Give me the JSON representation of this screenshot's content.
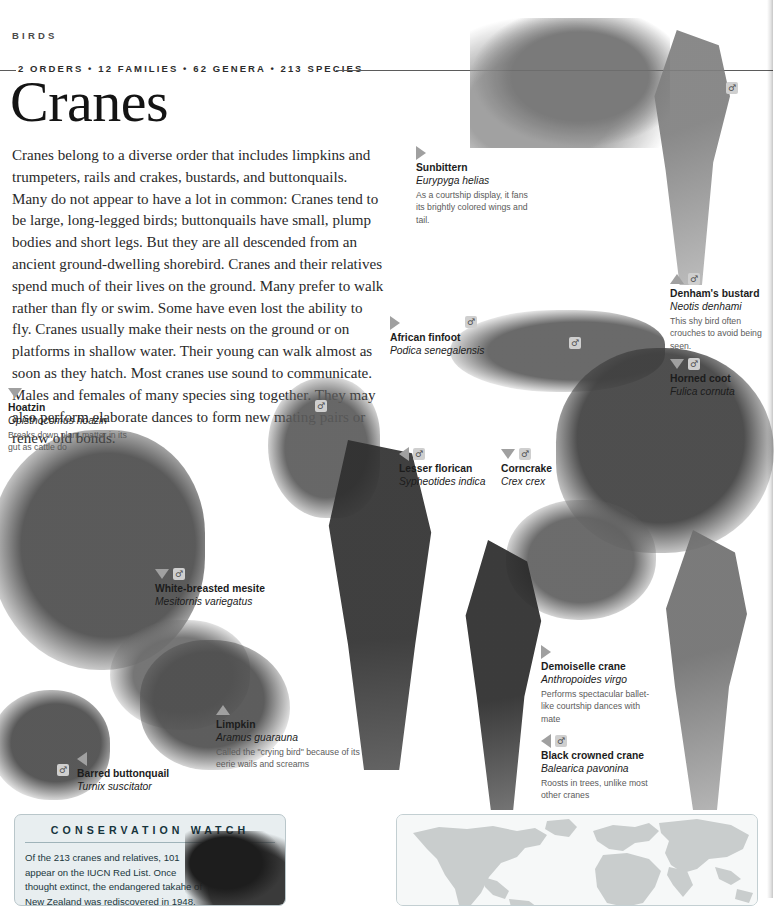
{
  "header": {
    "running_head": "BIRDS",
    "stats": "2 ORDERS • 12 FAMILIES • 62 GENERA • 213 SPECIES",
    "title": "Cranes"
  },
  "intro": "Cranes belong to a diverse order that includes limpkins and trumpeters, rails and crakes, bustards, and buttonquails. Many do not appear to have a lot in common: Cranes tend to be large, long-legged birds; buttonquails have small, plump bodies and short legs. But they are all descended from an ancient ground-dwelling shorebird. Cranes and their relatives spend much of their lives on the ground. Many prefer to walk rather than fly or swim. Some have even lost the ability to fly. Cranes usually make their nests on the ground or on platforms in shallow water. Their young can walk almost as soon as they hatch. Most cranes use sound to communicate. Males and females of many species sing together. They may also perform elaborate dances to form new mating pairs or renew old bonds.",
  "captions": [
    {
      "id": "sunbittern",
      "common": "Sunbittern",
      "latin": "Eurypyga helias",
      "note": "As a courtship display, it fans its brightly colored wings and tail.",
      "pointer": "right",
      "badge": ""
    },
    {
      "id": "denhams-bustard",
      "common": "Denham's bustard",
      "latin": "Neotis denhami",
      "note": "This shy bird often crouches to avoid being seen.",
      "pointer": "up",
      "badge": "♂"
    },
    {
      "id": "horned-coot",
      "common": "Horned coot",
      "latin": "Fulica cornuta",
      "note": "",
      "pointer": "down",
      "badge": "♂"
    },
    {
      "id": "african-finfoot",
      "common": "African finfoot",
      "latin": "Podica senegalensis",
      "note": "",
      "pointer": "right",
      "badge": ""
    },
    {
      "id": "hoatzin",
      "common": "Hoatzin",
      "latin": "Opisthocomus hoazin",
      "note": "Breaks down plant matter in its gut as cattle do",
      "pointer": "down",
      "badge": ""
    },
    {
      "id": "lesser-florican",
      "common": "Lesser florican",
      "latin": "Sypheotides indica",
      "note": "",
      "pointer": "left",
      "badge": "♂"
    },
    {
      "id": "corncrake",
      "common": "Corncrake",
      "latin": "Crex crex",
      "note": "",
      "pointer": "down",
      "badge": "♂"
    },
    {
      "id": "mesite",
      "common": "White-breasted mesite",
      "latin": "Mesitornis variegatus",
      "note": "",
      "pointer": "down",
      "badge": "♂"
    },
    {
      "id": "limpkin",
      "common": "Limpkin",
      "latin": "Aramus guarauna",
      "note": "Called the \"crying bird\" because of its eerie wails and screams",
      "pointer": "up",
      "badge": ""
    },
    {
      "id": "barred-buttonquail",
      "common": "Barred buttonquail",
      "latin": "Turnix suscitator",
      "note": "",
      "pointer": "left",
      "badge": ""
    },
    {
      "id": "demoiselle-crane",
      "common": "Demoiselle crane",
      "latin": "Anthropoides virgo",
      "note": "Performs spectacular ballet-like courtship dances with mate",
      "pointer": "right",
      "badge": ""
    },
    {
      "id": "black-crowned-crane",
      "common": "Black crowned crane",
      "latin": "Balearica pavonina",
      "note": "Roosts in trees, unlike most other cranes",
      "pointer": "left",
      "badge": "♂"
    }
  ],
  "free_badges": [
    {
      "symbol": "♂",
      "x": 726,
      "y": 82
    },
    {
      "symbol": "♂",
      "x": 465,
      "y": 316
    },
    {
      "symbol": "♂",
      "x": 569,
      "y": 337
    },
    {
      "symbol": "♂",
      "x": 315,
      "y": 400
    },
    {
      "symbol": "♂",
      "x": 57,
      "y": 764
    }
  ],
  "conservation": {
    "title": "CONSERVATION WATCH",
    "body": "Of the 213 cranes and relatives, 101 appear on the IUCN Red List. Once thought extinct, the endangered takahe of New Zealand was rediscovered in 1948. Introduced species"
  },
  "colors": {
    "ink": "#231f20",
    "rule": "#5b5b5b",
    "caption_note": "#5b5b5b",
    "pointer": "#a0a0a0",
    "panel_bg": "#e8eef0",
    "panel_border": "#b9c6ca",
    "panel_heading": "#16343d",
    "map_land": "#c9cdcd",
    "map_bg": "#f6f8f8"
  }
}
